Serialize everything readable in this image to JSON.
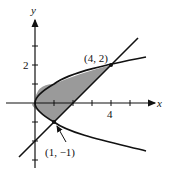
{
  "diagram": {
    "type": "region-between-curves",
    "curves": [
      "x = y^2",
      "y = x - 2"
    ],
    "axis_labels": {
      "x": "x",
      "y": "y"
    },
    "tick_labels": {
      "x": [
        "4"
      ],
      "y": [
        "2"
      ]
    },
    "points": [
      {
        "label": "(4, 2)",
        "x": 4,
        "y": 2
      },
      {
        "label": "(1, −1)",
        "x": 1,
        "y": -1
      }
    ],
    "shading_color": "#9a9a9a",
    "line_color": "#111111"
  }
}
